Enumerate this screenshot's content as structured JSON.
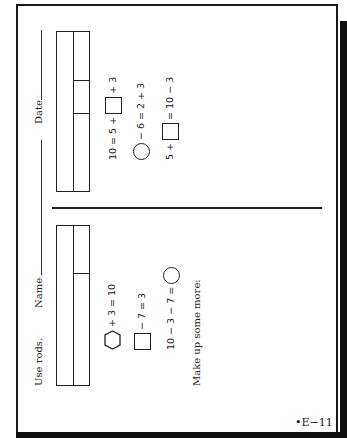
{
  "page": {
    "orientation": "rotated-90",
    "page_number": "•E−11"
  },
  "header": {
    "instruction": "Use rods.",
    "name_label": "Name",
    "date_label": "Date"
  },
  "left_section": {
    "rod_table": {
      "columns": 2,
      "right_column_segments": 2
    },
    "problems": [
      {
        "shape": "hexagon",
        "text_after": "+ 3 = 10"
      },
      {
        "shape": "square",
        "text_after": "− 7 = 3"
      },
      {
        "text_before": "10 − 3 − 7 =",
        "shape": "circle"
      }
    ],
    "prompt": "Make up some more:"
  },
  "right_section": {
    "rod_table": {
      "columns": 2,
      "right_column_segments": 3
    },
    "problems": [
      {
        "text_before": "10 = 5 +",
        "shape": "square",
        "text_after": "+ 3"
      },
      {
        "shape": "circle",
        "text_after": "− 6 = 2 + 3"
      },
      {
        "text_before": "5 +",
        "shape": "square",
        "text_after": "= 10 − 3"
      }
    ]
  }
}
